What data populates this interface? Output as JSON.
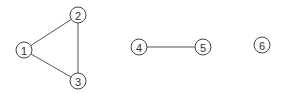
{
  "graph": {
    "nodes": [
      {
        "id": "1",
        "label": "1",
        "x": 24,
        "y": 50
      },
      {
        "id": "2",
        "label": "2",
        "x": 78,
        "y": 15
      },
      {
        "id": "3",
        "label": "3",
        "x": 78,
        "y": 81
      },
      {
        "id": "4",
        "label": "4",
        "x": 139,
        "y": 47
      },
      {
        "id": "5",
        "label": "5",
        "x": 203,
        "y": 47
      },
      {
        "id": "6",
        "label": "6",
        "x": 262,
        "y": 45
      }
    ],
    "edges": [
      {
        "from": "1",
        "to": "2"
      },
      {
        "from": "1",
        "to": "3"
      },
      {
        "from": "2",
        "to": "3"
      },
      {
        "from": "4",
        "to": "5"
      }
    ],
    "node_radius": 8
  }
}
